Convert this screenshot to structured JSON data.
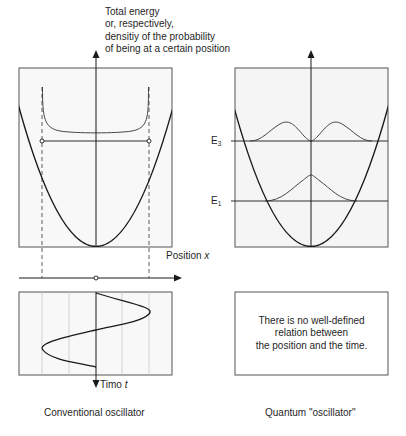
{
  "header": {
    "y_axis_title_lines": [
      "Total energy",
      "or, respectively,",
      "densitiy of the probability",
      "of being at a certain position"
    ]
  },
  "classical_panel": {
    "x_axis_label_text": "Position ",
    "x_axis_label_var": "x",
    "time_axis_label_text": "Timo ",
    "time_axis_label_var": "t",
    "caption": "Conventional oscillator",
    "turning_points": [
      "left",
      "right"
    ]
  },
  "quantum_panel": {
    "energy_levels": [
      {
        "label": "E",
        "sub": "3"
      },
      {
        "label": "E",
        "sub": "1"
      }
    ],
    "note_lines": [
      "There is no well-defined",
      "relation between",
      "the position and the time."
    ],
    "caption": "Quantum \"oscillator\""
  },
  "colors": {
    "line": "#1a1a1a",
    "grid": "#c8c8c8",
    "box": "#555555",
    "panel_bg": "#f7f7f7"
  }
}
